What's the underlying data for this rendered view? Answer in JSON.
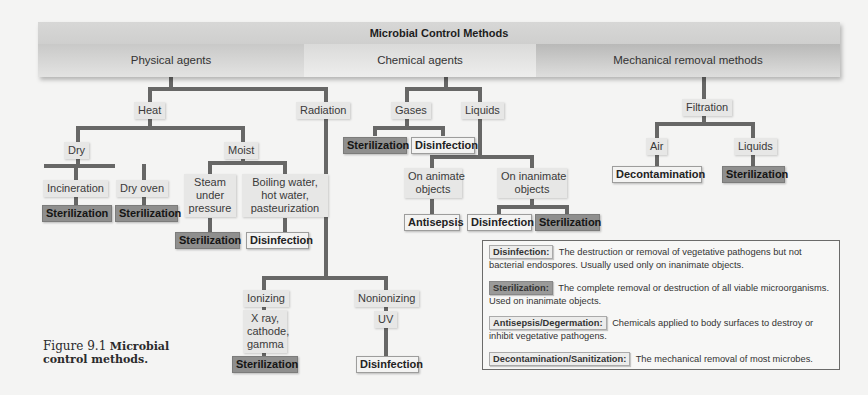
{
  "header": {
    "title": "Microbial Control Methods",
    "categories": [
      "Physical agents",
      "Chemical agents",
      "Mechanical removal methods"
    ]
  },
  "physical": {
    "heat": "Heat",
    "radiation": "Radiation",
    "dry": "Dry",
    "moist": "Moist",
    "incineration": "Incineration",
    "dry_oven": "Dry oven",
    "steam": [
      "Steam",
      "under",
      "pressure"
    ],
    "boiling": [
      "Boiling water,",
      "hot water,",
      "pasteurization"
    ],
    "ionizing": "Ionizing",
    "ionizing_types": [
      "X ray,",
      "cathode,",
      "gamma"
    ],
    "nonionizing": "Nonionizing",
    "uv": "UV",
    "results": {
      "incineration": "Sterilization",
      "dry_oven": "Sterilization",
      "steam": "Sterilization",
      "boiling": "Disinfection",
      "ionizing": "Sterilization",
      "uv": "Disinfection"
    }
  },
  "chemical": {
    "gases": "Gases",
    "liquids": "Liquids",
    "on_animate": [
      "On animate",
      "objects"
    ],
    "on_inanimate": [
      "On inanimate",
      "objects"
    ],
    "results": {
      "gases_1": "Sterilization",
      "gases_2": "Disinfection",
      "animate": "Antisepsis",
      "inanimate_1": "Disinfection",
      "inanimate_2": "Sterilization"
    }
  },
  "mechanical": {
    "filtration": "Filtration",
    "air": "Air",
    "liquids": "Liquids",
    "results": {
      "air": "Decontamination",
      "liquids": "Sterilization"
    }
  },
  "legend": [
    {
      "term": "Disinfection:",
      "style": "light",
      "definition": "The destruction or removal of vegetative pathogens but not bacterial endospores. Usually used only on inanimate objects."
    },
    {
      "term": "Sterilization:",
      "style": "dark",
      "definition": "The complete removal or destruction of all viable microorganisms. Used on inanimate objects."
    },
    {
      "term": "Antisepsis/Degermation:",
      "style": "light",
      "definition": "Chemicals applied to body surfaces to destroy or inhibit vegetative pathogens."
    },
    {
      "term": "Decontamination/Sanitization:",
      "style": "light",
      "definition": "The mechanical removal of most microbes."
    }
  ],
  "caption": {
    "figure": "Figure 9.1",
    "text_line1": "Microbial",
    "text_line2": "control methods."
  }
}
